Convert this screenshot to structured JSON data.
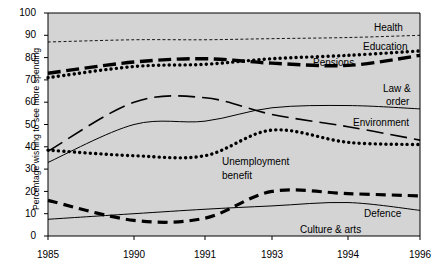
{
  "chart_data": {
    "type": "line",
    "title": "",
    "xlabel": "",
    "ylabel": "Percentage wishing to see more spending",
    "ylim": [
      0,
      100
    ],
    "yticks": [
      0,
      10,
      20,
      30,
      40,
      50,
      60,
      70,
      80,
      90,
      100
    ],
    "x": [
      "1985",
      "1990",
      "1991",
      "1993",
      "1994",
      "1996"
    ],
    "xtick_labels": [
      "1985",
      "1990",
      "1991",
      "1993",
      "1994",
      "1996"
    ],
    "grid": false,
    "legend": "inline-right-labels",
    "plot_background": "#d4d4d4",
    "series": [
      {
        "name": "Health",
        "style": "fine-dashed",
        "values": [
          87,
          88,
          88,
          88.5,
          89,
          90
        ]
      },
      {
        "name": "Education",
        "style": "heavy-dotted",
        "values": [
          71,
          76,
          77,
          79.5,
          81,
          83
        ]
      },
      {
        "name": "Pensions",
        "style": "heavy-dash-dot",
        "values": [
          73,
          78,
          79.5,
          77.5,
          76.5,
          81
        ]
      },
      {
        "name": "Law & order",
        "style": "thin-solid",
        "values": [
          33,
          50,
          51.5,
          57.5,
          58.5,
          57
        ]
      },
      {
        "name": "Environment",
        "style": "long-dash",
        "values": [
          38,
          60,
          62,
          54.5,
          49,
          43
        ]
      },
      {
        "name": "Unemployment benefit",
        "style": "heavy-dotted",
        "values": [
          38.5,
          36,
          36,
          47.5,
          42,
          41
        ]
      },
      {
        "name": "Defence",
        "style": "heavy-dashed",
        "values": [
          16,
          7,
          8,
          20,
          19,
          18
        ]
      },
      {
        "name": "Culture & arts",
        "style": "thin-solid",
        "values": [
          7.5,
          10,
          12,
          13.5,
          15,
          11.5
        ]
      }
    ],
    "annotations": [
      {
        "text": "Health",
        "near_series": "Health"
      },
      {
        "text": "Education",
        "near_series": "Education"
      },
      {
        "text": "Pensions",
        "near_series": "Pensions"
      },
      {
        "text": "Law &",
        "near_series": "Law & order"
      },
      {
        "text": "order",
        "near_series": "Law & order"
      },
      {
        "text": "Environment",
        "near_series": "Environment"
      },
      {
        "text": "Unemployment",
        "near_series": "Unemployment benefit"
      },
      {
        "text": "benefit",
        "near_series": "Unemployment benefit"
      },
      {
        "text": "Defence",
        "near_series": "Defence"
      },
      {
        "text": "Culture & arts",
        "near_series": "Culture & arts"
      }
    ]
  },
  "axis": {
    "y_title": "Percentage wishing to see more spending",
    "y_ticks": [
      "100",
      "90",
      "80",
      "70",
      "60",
      "50",
      "40",
      "30",
      "20",
      "10",
      "0"
    ],
    "x_ticks": [
      "1985",
      "1990",
      "1991",
      "1993",
      "1994",
      "1996"
    ]
  },
  "labels": {
    "health": "Health",
    "education": "Education",
    "pensions": "Pensions",
    "law_line1": "Law &",
    "law_line2": "order",
    "environment": "Environment",
    "unemployment_line1": "Unemployment",
    "unemployment_line2": "benefit",
    "defence": "Defence",
    "culture": "Culture & arts"
  },
  "colors": {
    "plot_bg": "#d4d4d4",
    "line": "#000000",
    "page_bg": "#ffffff"
  }
}
